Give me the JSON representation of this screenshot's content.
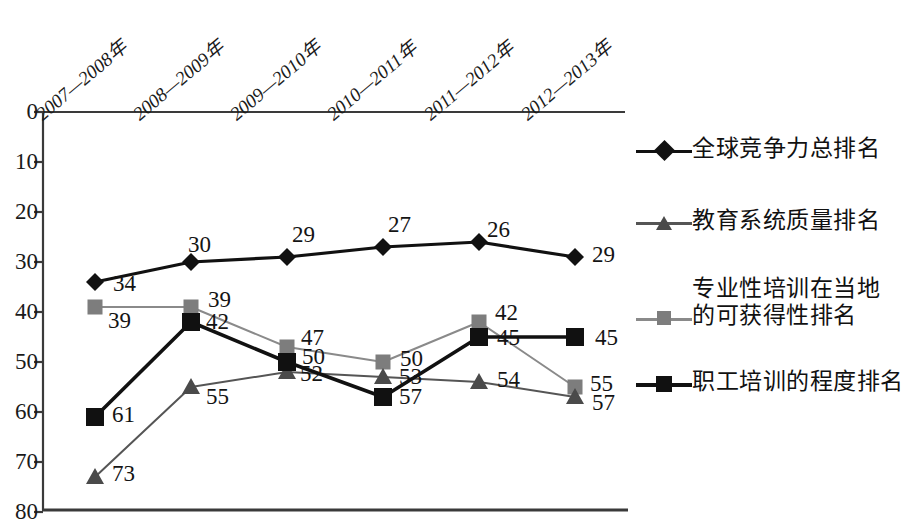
{
  "chart_data": {
    "type": "line",
    "title": "",
    "subtitle": "",
    "xlabel": "",
    "ylabel": "",
    "categories": [
      "2007—2008年",
      "2008—2009年",
      "2009—2010年",
      "2010—2011年",
      "2011—2012年",
      "2012—2013年"
    ],
    "ylim": [
      0,
      80
    ],
    "y_inverted": true,
    "y_ticks": [
      0,
      10,
      20,
      30,
      40,
      50,
      60,
      70,
      80
    ],
    "grid": false,
    "legend_position": "right",
    "series": [
      {
        "name": "全球竞争力总排名",
        "marker": "diamond",
        "color": "#111111",
        "line_color": "#111111",
        "line_width": 3.2,
        "values": [
          34,
          30,
          29,
          27,
          26,
          29
        ]
      },
      {
        "name": "教育系统质量排名",
        "marker": "triangle",
        "color": "#4a4a4a",
        "line_color": "#555555",
        "line_width": 2.0,
        "values": [
          73,
          55,
          52,
          53,
          54,
          57
        ]
      },
      {
        "name": "专业性培训在当地的可获得性排名",
        "marker": "square",
        "color": "#7d7d7d",
        "line_color": "#8a8a8a",
        "line_width": 2.0,
        "values": [
          39,
          39,
          47,
          50,
          42,
          55
        ]
      },
      {
        "name": "职工培训的程度排名",
        "marker": "square",
        "color": "#111111",
        "line_color": "#111111",
        "line_width": 3.6,
        "values": [
          61,
          42,
          50,
          57,
          45,
          45
        ]
      }
    ],
    "point_labels": [
      {
        "series": 0,
        "index": 0,
        "text": "34",
        "x": 113,
        "y": 272
      },
      {
        "series": 0,
        "index": 1,
        "text": "30",
        "x": 188,
        "y": 233
      },
      {
        "series": 0,
        "index": 2,
        "text": "29",
        "x": 292,
        "y": 223
      },
      {
        "series": 0,
        "index": 3,
        "text": "27",
        "x": 388,
        "y": 213
      },
      {
        "series": 0,
        "index": 4,
        "text": "26",
        "x": 487,
        "y": 218
      },
      {
        "series": 0,
        "index": 5,
        "text": "29",
        "x": 592,
        "y": 243
      },
      {
        "series": 2,
        "index": 0,
        "text": "39",
        "x": 108,
        "y": 309
      },
      {
        "series": 2,
        "index": 1,
        "text": "39",
        "x": 208,
        "y": 288
      },
      {
        "series": 2,
        "index": 2,
        "text": "47",
        "x": 301,
        "y": 326
      },
      {
        "series": 2,
        "index": 3,
        "text": "50",
        "x": 400,
        "y": 347
      },
      {
        "series": 2,
        "index": 4,
        "text": "42",
        "x": 495,
        "y": 301
      },
      {
        "series": 2,
        "index": 5,
        "text": "55",
        "x": 590,
        "y": 372
      },
      {
        "series": 3,
        "index": 0,
        "text": "61",
        "x": 112,
        "y": 403
      },
      {
        "series": 3,
        "index": 1,
        "text": "42",
        "x": 206,
        "y": 310
      },
      {
        "series": 3,
        "index": 2,
        "text": "50",
        "x": 302,
        "y": 345
      },
      {
        "series": 3,
        "index": 3,
        "text": "57",
        "x": 399,
        "y": 385
      },
      {
        "series": 3,
        "index": 4,
        "text": "45",
        "x": 497,
        "y": 326
      },
      {
        "series": 3,
        "index": 5,
        "text": "45",
        "x": 595,
        "y": 326
      },
      {
        "series": 1,
        "index": 0,
        "text": "73",
        "x": 112,
        "y": 462
      },
      {
        "series": 1,
        "index": 1,
        "text": "55",
        "x": 206,
        "y": 385
      },
      {
        "series": 1,
        "index": 2,
        "text": "52",
        "x": 300,
        "y": 362
      },
      {
        "series": 1,
        "index": 3,
        "text": "53",
        "x": 399,
        "y": 365
      },
      {
        "series": 1,
        "index": 4,
        "text": "54",
        "x": 497,
        "y": 368
      },
      {
        "series": 1,
        "index": 5,
        "text": "57",
        "x": 592,
        "y": 391
      }
    ]
  },
  "axis": {
    "y_tick_labels": [
      "0",
      "10",
      "20",
      "30",
      "40",
      "50",
      "60",
      "70",
      "80"
    ],
    "x_tick_labels": [
      "2007—2008年",
      "2008—2009年",
      "2009—2010年",
      "2010—2011年",
      "2011—2012年",
      "2012—2013年"
    ]
  },
  "legend": {
    "items": [
      {
        "label": "全球竞争力总排名",
        "marker": "diamond-marker",
        "color": "#111111"
      },
      {
        "label": "教育系统质量排名",
        "marker": "triangle-marker",
        "color": "#4a4a4a"
      },
      {
        "label": "专业性培训在当地\n的可获得性排名",
        "marker": "square-marker",
        "color": "#7d7d7d"
      },
      {
        "label": "职工培训的程度排名",
        "marker": "square-marker",
        "color": "#111111"
      }
    ],
    "item3_line1": "专业性培训在当地",
    "item3_line2": "的可获得性排名"
  }
}
